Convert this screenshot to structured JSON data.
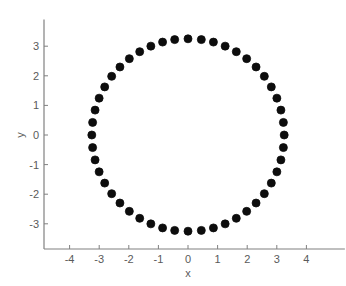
{
  "figure": {
    "width": 346,
    "height": 286,
    "background_color": "#ffffff"
  },
  "axes": {
    "line_color": "#808080",
    "tick_color": "#808080",
    "label_color": "#5a5a5a",
    "origin_px": {
      "x": 188,
      "y": 135
    },
    "px_per_unit": 29.6,
    "x_axis_y_px": 249,
    "y_axis_x_px": 44
  },
  "labels": {
    "xlabel": "x",
    "ylabel": "y"
  },
  "chart_data": {
    "type": "scatter",
    "title": "",
    "xlabel": "x",
    "ylabel": "y",
    "xlim": [
      -4.85,
      5.3
    ],
    "ylim": [
      -3.85,
      3.9
    ],
    "xticks": [
      -4,
      -3,
      -2,
      -1,
      0,
      1,
      2,
      3,
      4
    ],
    "xticklabels": [
      "-4",
      "-3",
      "-2",
      "-1",
      "0",
      "1",
      "2",
      "3",
      "4"
    ],
    "yticks": [
      -3,
      -2,
      -1,
      0,
      1,
      2,
      3
    ],
    "yticklabels": [
      "-3",
      "-2",
      "-1",
      "0",
      "1",
      "2",
      "3"
    ],
    "grid": false,
    "legend": null,
    "marker": {
      "shape": "circle",
      "filled": true,
      "color": "#0d0d0d",
      "size_px": 8
    },
    "series": [
      {
        "name": "circle",
        "radius": 3.25,
        "center": [
          0,
          0
        ],
        "n_points": 48,
        "x": [
          3.25,
          3.2222,
          3.1392,
          3.0024,
          2.8145,
          2.5787,
          2.2995,
          1.9818,
          1.6315,
          1.2549,
          0.8587,
          0.45,
          0.0,
          -0.45,
          -0.8587,
          -1.2549,
          -1.6315,
          -1.9818,
          -2.2995,
          -2.5787,
          -2.8145,
          -3.0024,
          -3.1392,
          -3.2222,
          -3.25,
          -3.2222,
          -3.1392,
          -3.0024,
          -2.8145,
          -2.5787,
          -2.2995,
          -1.9818,
          -1.6315,
          -1.2549,
          -0.8587,
          -0.45,
          0.0,
          0.45,
          0.8587,
          1.2549,
          1.6315,
          1.9818,
          2.2995,
          2.5787,
          2.8145,
          3.0024,
          3.1392,
          3.2222
        ],
        "y": [
          0.0,
          0.425,
          0.8409,
          1.2441,
          1.625,
          1.9823,
          2.2981,
          2.5787,
          2.8145,
          3.0024,
          3.1392,
          3.2222,
          3.25,
          3.2222,
          3.1392,
          3.0024,
          2.8145,
          2.5787,
          2.2981,
          1.9823,
          1.625,
          1.2441,
          0.8409,
          0.425,
          0.0,
          -0.425,
          -0.8409,
          -1.2441,
          -1.625,
          -1.9823,
          -2.2981,
          -2.5787,
          -2.8145,
          -3.0024,
          -3.1392,
          -3.2222,
          -3.25,
          -3.2222,
          -3.1392,
          -3.0024,
          -2.8145,
          -2.5787,
          -2.2981,
          -1.9823,
          -1.625,
          -1.2441,
          -0.8409,
          -0.425
        ]
      }
    ]
  }
}
